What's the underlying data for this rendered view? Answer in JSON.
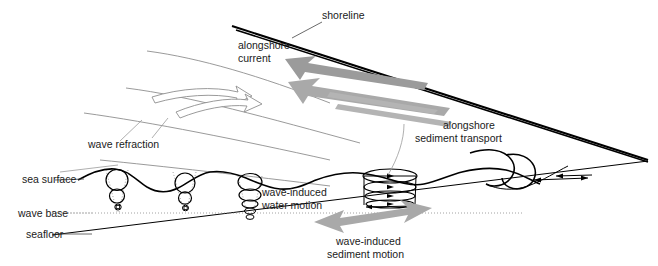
{
  "diagram": {
    "labels": {
      "shoreline": "shoreline",
      "alongshore_current_line1": "alongshore",
      "alongshore_current_line2": "current",
      "alongshore_sediment_line1": "alongshore",
      "alongshore_sediment_line2": "sediment transport",
      "wave_refraction": "wave refraction",
      "sea_surface": "sea surface",
      "wave_base": "wave base",
      "seafloor": "seafloor",
      "wave_induced_water_line1": "wave-induced",
      "wave_induced_water_line2": "water motion",
      "wave_induced_sediment_line1": "wave-induced",
      "wave_induced_sediment_line2": "sediment motion"
    },
    "colors": {
      "background": "#ffffff",
      "ink": "#000000",
      "text": "#1a1a1a",
      "refraction_crest": "#8e8e8e",
      "gray_arrow_dark": "#9b9b9b",
      "gray_arrow_mid": "#a9a9a9",
      "gray_arrow_light": "#b4b4b4",
      "dotted_guide": "#8a8a8a"
    },
    "features": {
      "orbital_columns": [
        {
          "name": "deep-water-orbit-1",
          "shape": "circles",
          "count": 3,
          "note": "circular orbits shrinking with depth"
        },
        {
          "name": "deep-water-orbit-2",
          "shape": "circles",
          "count": 3,
          "note": "circular orbits shrinking with depth"
        },
        {
          "name": "shoaling-orbit-3",
          "shape": "ellipses",
          "count": 5,
          "note": "orbits flatten into ellipses near seafloor"
        },
        {
          "name": "shallow-orbit-4",
          "shape": "flat-ellipses",
          "count": 4,
          "note": "strongly flattened oscillatory motion"
        }
      ],
      "gray_arrows": [
        {
          "name": "alongshore-current-arrow",
          "direction": "up-left"
        },
        {
          "name": "alongshore-sediment-transport-arrow",
          "direction": "up-left"
        },
        {
          "name": "wave-induced-sediment-motion-arrow",
          "direction": "bidirectional"
        }
      ],
      "refraction_crests": 4,
      "wave_count_on_sea_surface": 4
    }
  }
}
